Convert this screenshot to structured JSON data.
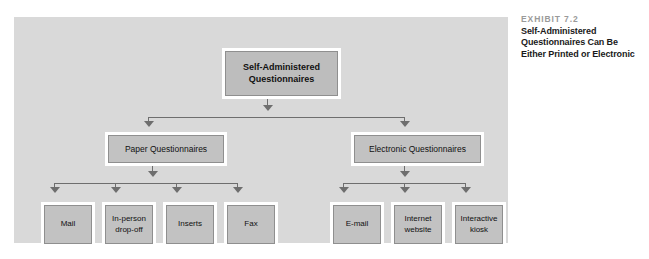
{
  "caption": {
    "exhibit_label": "EXHIBIT 7.2",
    "title_line_1": "Self-Administered",
    "title_line_2": "Questionnaires Can Be",
    "title_line_3": "Either Printed or Electronic"
  },
  "diagram": {
    "root": {
      "line_1": "Self-Administered",
      "line_2": "Questionnaires"
    },
    "level2": {
      "paper": "Paper Questionnaires",
      "electronic": "Electronic Questionnaires"
    },
    "paper_children": {
      "mail": "Mail",
      "inperson_line_1": "In-person",
      "inperson_line_2": "drop-off",
      "inserts": "Inserts",
      "fax": "Fax"
    },
    "electronic_children": {
      "email": "E-mail",
      "internet_line_1": "Internet",
      "internet_line_2": "website",
      "kiosk_line_1": "Interactive",
      "kiosk_line_2": "kiosk"
    }
  },
  "colors": {
    "panel_background": "#d9d9d9",
    "box_fill": "#c2c2c2",
    "box_border": "#8f8f8f",
    "box_frame": "#ffffff",
    "connector": "#6e6e6e",
    "exhibit_label_color": "#9a9a9a",
    "text_color": "#111111"
  }
}
